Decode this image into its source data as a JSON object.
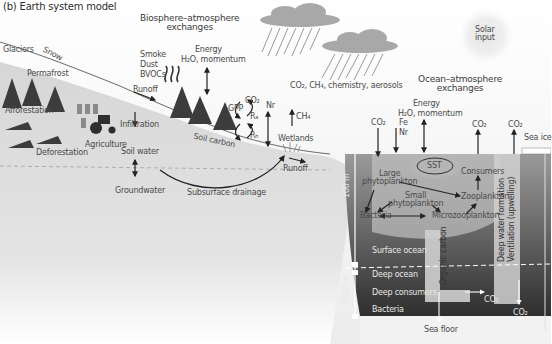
{
  "title": "(b) Earth system model",
  "headings": {
    "biosphere": [
      "Biosphere–atmosphere",
      "exchanges"
    ],
    "ocean": [
      "Ocean–atmosphere",
      "exchanges"
    ],
    "solar": [
      "Solar",
      "input"
    ]
  },
  "land": {
    "glaciers": "Glaciers",
    "snow": "Snow",
    "permafrost": "Permafrost",
    "afforestation": "Afforestation",
    "deforestation": "Deforestation",
    "agriculture": "Agriculture",
    "infiltration": "Infiltration",
    "soil_water": "Soil water",
    "groundwater": "Groundwater",
    "runoff_upper": "Runoff",
    "runoff_lower": "Runoff",
    "subsurface_drainage": "Subsurface drainage",
    "soil_carbon": "Soil carbon",
    "wetlands": "Wetlands",
    "smoke": "Smoke",
    "dust": "Dust",
    "bvocs": "BVOCs",
    "energy": "Energy",
    "h2o_momentum": "H₂O, momentum",
    "gpp": "GPP",
    "co2": "CO₂",
    "ra": "Rₐ",
    "rh": "Rₕ",
    "nr": "Nr",
    "ch4": "CH₄"
  },
  "atmosphere": {
    "chemistry": "CO₂, CH₄, chemistry, aerosols"
  },
  "ocean": {
    "co2_left": "CO₂",
    "fe": "Fe",
    "nr": "Nr",
    "energy": "Energy",
    "h2o_momentum": "H₂O, momentum",
    "co2_consumers": "CO₂",
    "co2_ice": "CO₂",
    "sea_ice": "Sea ice",
    "sst": "SST",
    "large_phyto": [
      "Large",
      "phytoplankton"
    ],
    "small_phyto": [
      "Small",
      "phytoplankton"
    ],
    "consumers": "Consumers",
    "zooplankton": "Zooplankton",
    "microzooplankton": "Microzooplankton",
    "bacteria_surface": "Bacteria",
    "surface_ocean": "Surface ocean",
    "deep_ocean": "Deep ocean",
    "deep_consumers": "Deep consumers",
    "bacteria_deep": "Bacteria",
    "organic_carbon": "Organic carbon",
    "deep_water_formation": "Deep water formation",
    "ventilation": "Ventilation (upwelling)",
    "co2_deep1": "CO₂",
    "co2_deep2": "CO₂",
    "sea_floor": "Sea floor",
    "depth_100": "100 m",
    "depth_3700": "3700 m"
  },
  "colors": {
    "land": "#d9d9d9",
    "sky": "#f2f2f2",
    "ocean_surface": "#a0a0a0",
    "ocean_deep": "#3a3a3a",
    "tree": "#3c3c3c"
  }
}
